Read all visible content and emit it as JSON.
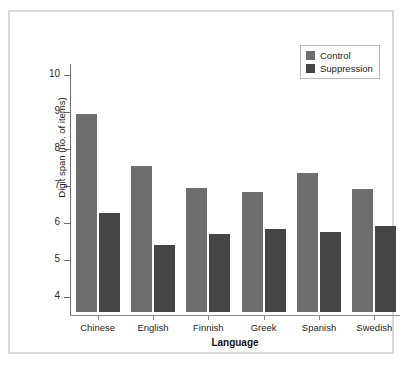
{
  "chart_data": {
    "type": "bar",
    "title": "",
    "subtitle": "",
    "xlabel": "Language",
    "ylabel": "Digit span (no. of items)",
    "categories": [
      "Chinese",
      "English",
      "Finnish",
      "Greek",
      "Spanish",
      "Swedish"
    ],
    "series": [
      {
        "name": "Control",
        "color": "#6e6e6e",
        "values": [
          8.95,
          7.55,
          6.95,
          6.85,
          7.35,
          6.92
        ]
      },
      {
        "name": "Suppression",
        "color": "#454545",
        "values": [
          6.28,
          5.4,
          5.7,
          5.83,
          5.75,
          5.92
        ]
      }
    ],
    "ylim": [
      3.6,
      10.4
    ],
    "yticks": [
      4,
      5,
      6,
      7,
      8,
      9,
      10
    ],
    "ytick_labels": [
      "4",
      "5",
      "6",
      "7",
      "8",
      "9",
      "10"
    ],
    "xtick_labels": [
      "Chinese",
      "English",
      "Finnish",
      "Greek",
      "Spanish",
      "Swedish"
    ],
    "grid": false,
    "legend_position": "top-right",
    "legend_entries": [
      "Control",
      "Suppression"
    ]
  },
  "legend": {
    "entries": [
      {
        "label": "Control",
        "swatch": "legend-swatch-control"
      },
      {
        "label": "Suppression",
        "swatch": "legend-swatch-suppression"
      }
    ]
  },
  "colors": {
    "control": "#6e6e6e",
    "suppression": "#454545",
    "frame": "#d8d8d8",
    "axis": "#6d6d6d",
    "background": "#ffffff"
  }
}
